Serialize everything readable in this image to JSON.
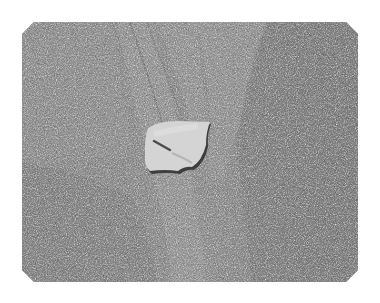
{
  "image": {
    "description": "Grayscale photograph of a flat pale shell fragment lying on coarse beach sand with faint drag tracks",
    "subject": "shell-fragment",
    "background": "sand",
    "colors": {
      "page": "#ffffff",
      "sand_base": "#8c8c8c",
      "sand_light": "#a6a6a6",
      "sand_dark": "#5e5e5e",
      "shell": "#d6d6d6",
      "shell_edge": "#3a3a3a"
    }
  }
}
